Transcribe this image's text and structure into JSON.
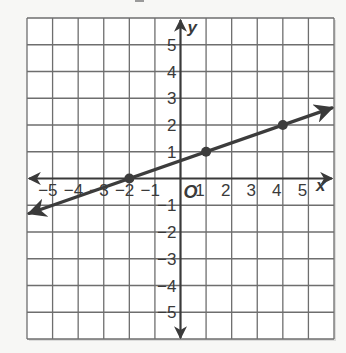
{
  "chart_data": {
    "type": "line",
    "title": "",
    "xlabel": "x",
    "ylabel": "y",
    "origin_label": "O",
    "xlim": [
      -6,
      6
    ],
    "ylim": [
      -6,
      6
    ],
    "grid": true,
    "x_tick_labels": [
      "-5",
      "-4",
      "-3",
      "-2",
      "-1",
      "1",
      "2",
      "3",
      "4",
      "5"
    ],
    "y_tick_labels": [
      "5",
      "4",
      "3",
      "2",
      "1",
      "-1",
      "-2",
      "-3",
      "-4",
      "-5"
    ],
    "x_ticks": [
      -5,
      -4,
      -3,
      -2,
      -1,
      1,
      2,
      3,
      4,
      5
    ],
    "y_ticks": [
      5,
      4,
      3,
      2,
      1,
      -1,
      -2,
      -3,
      -4,
      -5
    ],
    "series": [
      {
        "name": "line",
        "equation": "y = (1/3)x + 2/3",
        "slope": 0.3333,
        "y_intercept": 0.6667,
        "arrows_both_ends": true,
        "x": [
          -6,
          6
        ],
        "y": [
          -1.3333,
          2.6667
        ]
      }
    ],
    "points": [
      {
        "x": -2,
        "y": 0
      },
      {
        "x": 1,
        "y": 1
      },
      {
        "x": 4,
        "y": 2
      }
    ]
  },
  "style": {
    "grid_color": "#6e6e6e",
    "axis_color": "#3a3a3a",
    "line_color": "#3c3c3c",
    "background": "#ffffff"
  }
}
